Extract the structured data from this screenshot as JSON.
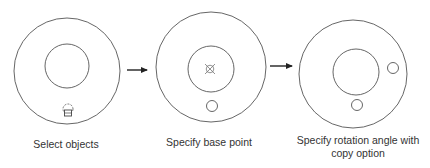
{
  "steps": [
    {
      "label": "Select objects",
      "icon": "selection-pickbox-icon"
    },
    {
      "label": "Specify base point",
      "icon": "base-point-marker-icon"
    },
    {
      "label": "Specify rotation angle with copy option",
      "icon": "rotated-copy-circles"
    }
  ],
  "colors": {
    "stroke": "#555555",
    "arrow": "#222222",
    "text": "#333333",
    "background": "#ffffff"
  }
}
